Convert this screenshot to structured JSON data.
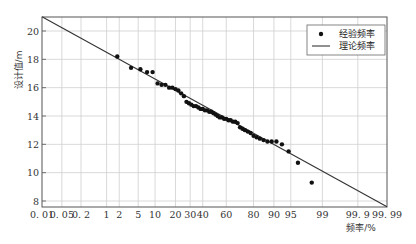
{
  "chart_data": {
    "type": "scatter",
    "title": "",
    "xlabel": "频率/%",
    "ylabel": "设计值/m",
    "x_scale": "probability",
    "ylim": [
      7.6,
      21.0
    ],
    "x_ticks": [
      "0.01",
      "0.05",
      "0.2",
      "1",
      "2",
      "5",
      "10",
      "20",
      "30",
      "40",
      "60",
      "80",
      "90",
      "95",
      "99",
      "99.9",
      "99.99"
    ],
    "x_tick_values": [
      0.01,
      0.05,
      0.2,
      1,
      2,
      5,
      10,
      20,
      30,
      40,
      60,
      80,
      90,
      95,
      99,
      99.9,
      99.99
    ],
    "y_ticks": [
      8,
      10,
      12,
      14,
      16,
      18,
      20
    ],
    "grid": true,
    "legend": {
      "position": "upper right",
      "entries": [
        {
          "label": "经验频率",
          "marker": "dot"
        },
        {
          "label": "理论频率",
          "marker": "line"
        }
      ]
    },
    "series": [
      {
        "name": "经验频率",
        "kind": "scatter",
        "points": [
          {
            "p": 1.8,
            "v": 18.2
          },
          {
            "p": 3.6,
            "v": 17.4
          },
          {
            "p": 5.5,
            "v": 17.3
          },
          {
            "p": 7.3,
            "v": 17.1
          },
          {
            "p": 9.1,
            "v": 17.1
          },
          {
            "p": 11,
            "v": 16.3
          },
          {
            "p": 12.7,
            "v": 16.2
          },
          {
            "p": 14.5,
            "v": 16.2
          },
          {
            "p": 16.4,
            "v": 16.0
          },
          {
            "p": 18.2,
            "v": 16.0
          },
          {
            "p": 20,
            "v": 15.9
          },
          {
            "p": 21.8,
            "v": 15.8
          },
          {
            "p": 23.6,
            "v": 15.6
          },
          {
            "p": 25.5,
            "v": 15.4
          },
          {
            "p": 27.3,
            "v": 15.0
          },
          {
            "p": 29.1,
            "v": 14.9
          },
          {
            "p": 30.9,
            "v": 14.8
          },
          {
            "p": 32.7,
            "v": 14.7
          },
          {
            "p": 34.5,
            "v": 14.7
          },
          {
            "p": 36.4,
            "v": 14.6
          },
          {
            "p": 38.2,
            "v": 14.5
          },
          {
            "p": 40,
            "v": 14.5
          },
          {
            "p": 41.8,
            "v": 14.4
          },
          {
            "p": 43.6,
            "v": 14.4
          },
          {
            "p": 45.5,
            "v": 14.3
          },
          {
            "p": 47.3,
            "v": 14.3
          },
          {
            "p": 49.1,
            "v": 14.2
          },
          {
            "p": 50.9,
            "v": 14.1
          },
          {
            "p": 52.7,
            "v": 14.0
          },
          {
            "p": 54.5,
            "v": 13.9
          },
          {
            "p": 56.4,
            "v": 13.9
          },
          {
            "p": 58.2,
            "v": 13.8
          },
          {
            "p": 60,
            "v": 13.8
          },
          {
            "p": 61.8,
            "v": 13.7
          },
          {
            "p": 63.6,
            "v": 13.7
          },
          {
            "p": 65.5,
            "v": 13.6
          },
          {
            "p": 67.3,
            "v": 13.6
          },
          {
            "p": 69.1,
            "v": 13.5
          },
          {
            "p": 70.9,
            "v": 13.2
          },
          {
            "p": 72.7,
            "v": 13.1
          },
          {
            "p": 74.5,
            "v": 13.0
          },
          {
            "p": 76.4,
            "v": 12.9
          },
          {
            "p": 78.2,
            "v": 12.8
          },
          {
            "p": 80,
            "v": 12.6
          },
          {
            "p": 81.8,
            "v": 12.5
          },
          {
            "p": 83.6,
            "v": 12.4
          },
          {
            "p": 85.5,
            "v": 12.3
          },
          {
            "p": 87.3,
            "v": 12.2
          },
          {
            "p": 89.1,
            "v": 12.2
          },
          {
            "p": 90.9,
            "v": 12.2
          },
          {
            "p": 92.7,
            "v": 12.0
          },
          {
            "p": 94.5,
            "v": 11.5
          },
          {
            "p": 96.4,
            "v": 10.7
          },
          {
            "p": 98.2,
            "v": 9.3
          }
        ]
      },
      {
        "name": "理论频率",
        "kind": "line",
        "points": [
          {
            "p": 0.01,
            "v": 21.0
          },
          {
            "p": 99.99,
            "v": 7.6
          }
        ]
      }
    ]
  }
}
